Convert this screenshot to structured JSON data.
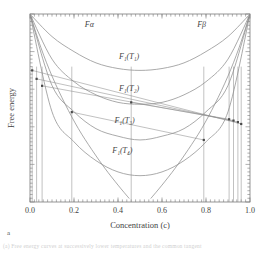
{
  "figure": {
    "panel_label": "a",
    "caption_fragment": "(a) Free energy curves at successively lower temperatures and the common tangent"
  },
  "chart_data": {
    "type": "line",
    "title": "",
    "xlabel": "Concentration (c)",
    "ylabel": "Free energy",
    "xlim": [
      0.0,
      1.0
    ],
    "ylim": [
      0.0,
      1.0
    ],
    "grid": false,
    "legend": "none",
    "x_ticks": [
      "0.0",
      "0.2",
      "0.4",
      "0.6",
      "0.8",
      "1.0"
    ],
    "x_tick_values": [
      0.0,
      0.2,
      0.4,
      0.6,
      0.8,
      1.0
    ],
    "y_ticks": [],
    "minor_ticks_per_interval": 10,
    "tick_direction": "in",
    "axis_box": true,
    "annotations": [
      {
        "text": "Fα",
        "x": 0.27,
        "y": 0.93
      },
      {
        "text": "Fβ",
        "x": 0.78,
        "y": 0.93
      },
      {
        "text": "F₁(T₁)",
        "x": 0.45,
        "y": 0.76
      },
      {
        "text": "F₁(T₂)",
        "x": 0.45,
        "y": 0.59
      },
      {
        "text": "F₁(T₃)",
        "x": 0.43,
        "y": 0.42
      },
      {
        "text": "F₁(T₄)",
        "x": 0.42,
        "y": 0.26
      }
    ],
    "series": [
      {
        "name": "Fα",
        "label": "Fα",
        "kind": "steep-left",
        "points": [
          [
            0.0,
            1.0
          ],
          [
            0.05,
            0.82
          ],
          [
            0.1,
            0.67
          ],
          [
            0.16,
            0.52
          ],
          [
            0.22,
            0.39
          ],
          [
            0.28,
            0.28
          ],
          [
            0.34,
            0.18
          ],
          [
            0.4,
            0.09
          ],
          [
            0.45,
            0.02
          ]
        ]
      },
      {
        "name": "Fβ",
        "label": "Fβ",
        "kind": "steep-right",
        "points": [
          [
            1.0,
            1.0
          ],
          [
            0.95,
            0.82
          ],
          [
            0.9,
            0.67
          ],
          [
            0.84,
            0.52
          ],
          [
            0.78,
            0.39
          ],
          [
            0.72,
            0.28
          ],
          [
            0.66,
            0.18
          ],
          [
            0.6,
            0.09
          ],
          [
            0.55,
            0.02
          ]
        ]
      },
      {
        "name": "F1T1",
        "label": "F₁(T₁)",
        "kind": "u-curve",
        "points": [
          [
            0.0,
            1.0
          ],
          [
            0.1,
            0.88
          ],
          [
            0.2,
            0.8
          ],
          [
            0.3,
            0.74
          ],
          [
            0.4,
            0.71
          ],
          [
            0.5,
            0.7
          ],
          [
            0.6,
            0.71
          ],
          [
            0.7,
            0.74
          ],
          [
            0.8,
            0.8
          ],
          [
            0.9,
            0.88
          ],
          [
            1.0,
            1.0
          ]
        ]
      },
      {
        "name": "F1T2",
        "label": "F₁(T₂)",
        "kind": "u-curve",
        "points": [
          [
            0.0,
            1.0
          ],
          [
            0.1,
            0.76
          ],
          [
            0.2,
            0.64
          ],
          [
            0.3,
            0.57
          ],
          [
            0.4,
            0.53
          ],
          [
            0.5,
            0.52
          ],
          [
            0.6,
            0.53
          ],
          [
            0.7,
            0.57
          ],
          [
            0.8,
            0.64
          ],
          [
            0.9,
            0.76
          ],
          [
            1.0,
            1.0
          ]
        ]
      },
      {
        "name": "F1T3",
        "label": "F₁(T₃)",
        "kind": "u-curve",
        "points": [
          [
            0.0,
            1.0
          ],
          [
            0.1,
            0.62
          ],
          [
            0.2,
            0.48
          ],
          [
            0.3,
            0.39
          ],
          [
            0.4,
            0.35
          ],
          [
            0.5,
            0.33
          ],
          [
            0.6,
            0.35
          ],
          [
            0.7,
            0.39
          ],
          [
            0.8,
            0.48
          ],
          [
            0.9,
            0.62
          ],
          [
            1.0,
            1.0
          ]
        ]
      },
      {
        "name": "F1T4",
        "label": "F₁(T₄)",
        "kind": "u-curve",
        "points": [
          [
            0.0,
            1.0
          ],
          [
            0.1,
            0.48
          ],
          [
            0.2,
            0.32
          ],
          [
            0.3,
            0.22
          ],
          [
            0.4,
            0.16
          ],
          [
            0.5,
            0.14
          ],
          [
            0.6,
            0.16
          ],
          [
            0.7,
            0.22
          ],
          [
            0.8,
            0.32
          ],
          [
            0.9,
            0.48
          ],
          [
            1.0,
            1.0
          ]
        ]
      }
    ],
    "tangent_constructions": [
      {
        "name": "tangent-T2",
        "x1": 0.055,
        "y1": 0.618,
        "x2": 0.925,
        "y2": 0.433
      },
      {
        "name": "tangent-T3",
        "x1": 0.03,
        "y1": 0.655,
        "x2": 0.945,
        "y2": 0.425
      },
      {
        "name": "tangent-alpha-beta",
        "x1": 0.19,
        "y1": 0.478,
        "x2": 0.79,
        "y2": 0.33
      },
      {
        "name": "tangent-T4",
        "x1": 0.01,
        "y1": 0.7,
        "x2": 0.96,
        "y2": 0.415
      },
      {
        "name": "tangent-inner",
        "x1": 0.46,
        "y1": 0.53,
        "x2": 0.905,
        "y2": 0.44
      }
    ],
    "tangent_points": [
      {
        "c": 0.01,
        "y": 0.7
      },
      {
        "c": 0.03,
        "y": 0.655
      },
      {
        "c": 0.055,
        "y": 0.618
      },
      {
        "c": 0.19,
        "y": 0.478
      },
      {
        "c": 0.46,
        "y": 0.53
      },
      {
        "c": 0.79,
        "y": 0.33
      },
      {
        "c": 0.905,
        "y": 0.44
      },
      {
        "c": 0.925,
        "y": 0.433
      },
      {
        "c": 0.945,
        "y": 0.425
      },
      {
        "c": 0.96,
        "y": 0.415
      }
    ],
    "drop_lines": [
      0.01,
      0.03,
      0.055,
      0.19,
      0.46,
      0.79,
      0.905,
      0.925,
      0.945,
      0.96
    ]
  }
}
